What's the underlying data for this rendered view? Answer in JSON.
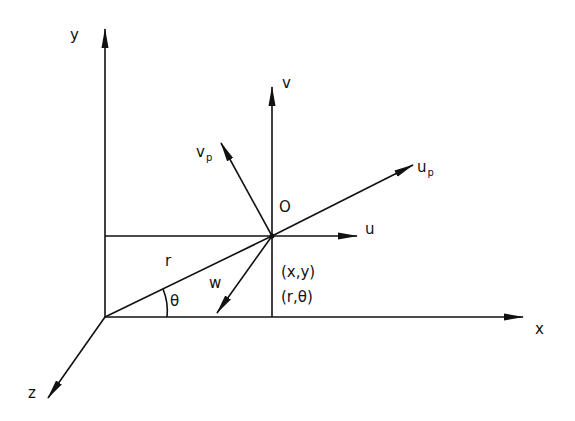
{
  "colors": {
    "ink": "#111111",
    "background": "#ffffff"
  },
  "labels": {
    "y_axis": "y",
    "x_axis": "x",
    "z_axis": "z",
    "origin": "O",
    "v": "v",
    "u": "u",
    "u_p_base": "u",
    "u_p_sub": "p",
    "v_p_base": "v",
    "v_p_sub": "p",
    "w": "w",
    "r": "r",
    "theta": "θ",
    "cartesian": "(x,y)",
    "polar": "(r,θ)"
  },
  "geometry": {
    "axes_origin": [
      105,
      317
    ],
    "point_O": [
      272,
      236
    ],
    "y_tip": [
      105,
      29
    ],
    "x_tip": [
      523,
      317
    ],
    "z_tip": [
      48,
      398
    ],
    "v_tip": [
      272,
      87
    ],
    "u_tip": [
      357,
      236
    ],
    "u_p_tip": [
      413,
      165
    ],
    "v_p_tip": [
      221,
      143
    ],
    "w_tip": [
      217,
      313
    ]
  }
}
